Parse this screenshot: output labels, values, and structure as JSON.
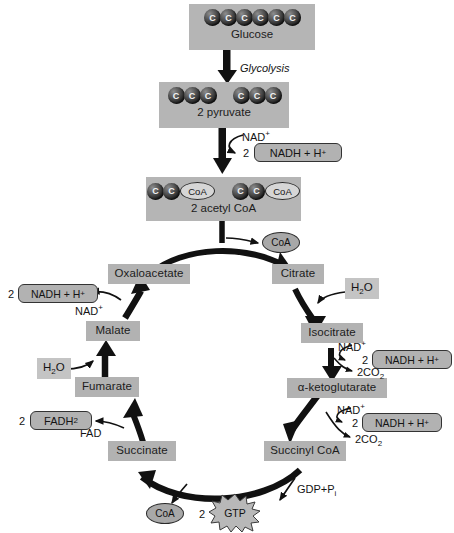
{
  "diagram": {
    "colors": {
      "background": "#ffffff",
      "panel_fill": "#b5b5b5",
      "molecule_fill": "#b2b2b2",
      "chip_fill": "#c4c4c4",
      "arrow": "#111111",
      "carbon_ball": "#333333",
      "outline": "#2a2a2a"
    }
  },
  "glucose": {
    "caption": "Glucose",
    "carbon_count": 6,
    "carbon_label": "C"
  },
  "glycolysis": {
    "label": "Glycolysis"
  },
  "pyruvate": {
    "caption": "2 pyruvate",
    "groups": [
      3,
      3
    ],
    "carbon_label": "C"
  },
  "pyruvate_oxidation": {
    "nad_label": "NAD",
    "nad_charge": "+",
    "coefficient": "2",
    "nadh_label": "NADH + H",
    "nadh_charge": "+"
  },
  "acetyl_coa": {
    "caption": "2 acetyl CoA",
    "groups": [
      2,
      2
    ],
    "carbon_label": "C",
    "coa_label": "CoA"
  },
  "released_coa": {
    "label": "CoA"
  },
  "cycle": {
    "oxaloacetate": "Oxaloacetate",
    "citrate": "Citrate",
    "isocitrate": "Isocitrate",
    "alpha_ketoglutarate": "α-ketoglutarate",
    "succinyl_coa": "Succinyl CoA",
    "succinate": "Succinate",
    "fumarate": "Fumarate",
    "malate": "Malate"
  },
  "citrate_step": {
    "water": "H",
    "water_sub": "2",
    "water_tail": "O"
  },
  "isocitrate_step": {
    "nad_label": "NAD",
    "nad_charge": "+",
    "coefficient": "2",
    "nadh_label": "NADH + H",
    "nadh_charge": "+",
    "co2_label": "2CO",
    "co2_sub": "2"
  },
  "ketoglutarate_step": {
    "nad_label": "NAD",
    "nad_charge": "+",
    "coefficient": "2",
    "nadh_label": "NADH + H",
    "nadh_charge": "+",
    "co2_label": "2CO",
    "co2_sub": "2"
  },
  "succinyl_step": {
    "gdp_label": "GDP+P",
    "gdp_sub": "i",
    "coa_label": "CoA",
    "gtp_coefficient": "2",
    "gtp_label": "GTP"
  },
  "succinate_step": {
    "fad_label": "FAD",
    "coefficient": "2",
    "fadh2_label": "FADH",
    "fadh2_sub": "2"
  },
  "fumarate_step": {
    "water": "H",
    "water_sub": "2",
    "water_tail": "O"
  },
  "malate_step": {
    "nad_label": "NAD",
    "nad_charge": "+",
    "coefficient": "2",
    "nadh_label": "NADH + H",
    "nadh_charge": "+"
  }
}
